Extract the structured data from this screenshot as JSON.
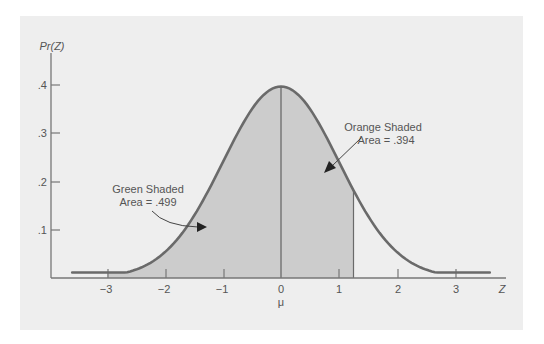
{
  "chart_data": {
    "type": "area",
    "title": "",
    "xlabel": "Z",
    "ylabel": "Pr(Z)",
    "x_sublabel": "μ",
    "xlim": [
      -3.7,
      3.9
    ],
    "ylim": [
      0,
      0.4
    ],
    "x_ticks": [
      "-3",
      "-2",
      "-1",
      "0",
      "1",
      "2",
      "3"
    ],
    "y_ticks": [
      ".1",
      ".2",
      ".3",
      ".4"
    ],
    "grid": false,
    "series": [
      {
        "name": "Standard normal density",
        "distribution": "normal",
        "mean": 0,
        "sd": 1,
        "peak": 0.399
      }
    ],
    "shaded_regions": [
      {
        "name": "Green Shaded",
        "from": -3,
        "to": 0,
        "area": 0.499
      },
      {
        "name": "Orange Shaded",
        "from": 0,
        "to": 1.25,
        "area": 0.394
      }
    ],
    "annotations": [
      {
        "line1": "Green Shaded",
        "line2": "Area = .499"
      },
      {
        "line1": "Orange Shaded",
        "line2": "Area = .394"
      }
    ]
  },
  "labels": {
    "y_axis": "Pr(Z)",
    "x_axis": "Z",
    "mu": "μ",
    "y_ticks": [
      ".4",
      ".3",
      ".2",
      ".1"
    ],
    "x_ticks": [
      "−3",
      "−2",
      "−1",
      "0",
      "1",
      "2",
      "3"
    ],
    "green_line1": "Green Shaded",
    "green_line2": "Area = .499",
    "orange_line1": "Orange Shaded",
    "orange_line2": "Area = .394"
  },
  "colors": {
    "panel": "#eeeeee",
    "shade": "#cccccc",
    "curve": "#6a6a6a",
    "axis": "#777777"
  }
}
